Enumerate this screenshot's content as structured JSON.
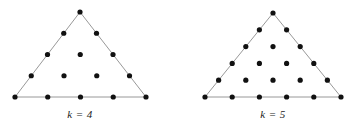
{
  "figure": {
    "title": "",
    "background_color": "#ffffff",
    "width": 356,
    "height": 127,
    "dot_color": "#111111",
    "edge_color": "#8c8c8c",
    "dot_radius": 2.6,
    "edge_width": 0.9
  },
  "chart_data": {
    "type": "scatter",
    "title": "",
    "xlabel": "",
    "ylabel": "",
    "grid": false,
    "legend": false,
    "panels": [
      {
        "id": "left",
        "label": "k = 4",
        "k": 4,
        "rows": 5,
        "dots_per_row": [
          1,
          2,
          3,
          4,
          5
        ],
        "total_dots": 15,
        "apex": [
          80,
          12
        ],
        "base_left": [
          15,
          97
        ],
        "base_right": [
          146,
          97
        ],
        "label_position": [
          80,
          118
        ]
      },
      {
        "id": "right",
        "label": "k = 5",
        "k": 5,
        "rows": 6,
        "dots_per_row": [
          1,
          2,
          3,
          4,
          5,
          6
        ],
        "total_dots": 21,
        "apex": [
          273,
          13
        ],
        "base_left": [
          205,
          97
        ],
        "base_right": [
          341,
          97
        ],
        "label_position": [
          273,
          118
        ]
      }
    ]
  },
  "labels": {
    "left_panel_label": "k = 4",
    "right_panel_label": "k = 5"
  }
}
